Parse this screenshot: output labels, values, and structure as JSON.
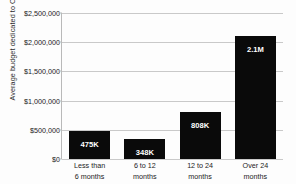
{
  "chart_data": {
    "type": "bar",
    "title": "",
    "xlabel": "",
    "ylabel": "Average budget dedicated to CM",
    "categories": [
      "Less than\n6 months",
      "6 to 12\nmonths",
      "12 to 24\nmonths",
      "Over 24\nmonths"
    ],
    "category_lines": [
      [
        "Less than",
        "6 months"
      ],
      [
        "6 to 12",
        "months"
      ],
      [
        "12 to 24",
        "months"
      ],
      [
        "Over 24",
        "months"
      ]
    ],
    "values": [
      475000,
      348000,
      808000,
      2100000
    ],
    "data_labels": [
      "475K",
      "348K",
      "808K",
      "2.1M"
    ],
    "ylim": [
      0,
      2500000
    ],
    "ytick_values": [
      0,
      500000,
      1000000,
      1500000,
      2000000,
      2500000
    ],
    "ytick_labels": [
      "$0",
      "$500,000",
      "$1,000,000",
      "$1,500,000",
      "$2,000,000",
      "$2,500,000"
    ],
    "grid": true,
    "grid_axis": "y",
    "legend": false,
    "bar_color": "#0a0a0a",
    "grid_color": "#c9c9c9",
    "background_color": "#fdfdfd",
    "label_text_color": "#ffffff"
  }
}
